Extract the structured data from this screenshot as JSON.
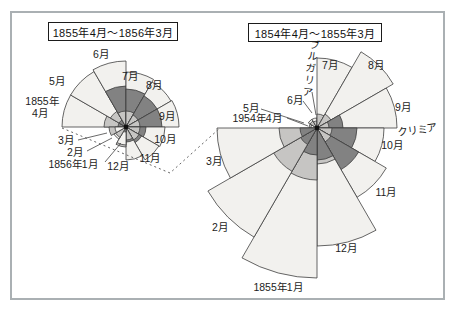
{
  "figure": {
    "width": 459,
    "height": 312,
    "frame_border_color": "#aab0b3",
    "background": "#ffffff"
  },
  "titles": {
    "left": "1855年4月～1856年3月",
    "right": "1854年4月～1855年3月"
  },
  "colors": {
    "light_wedge": "#f2f1ee",
    "dark_wedge": "#828282",
    "mid_wedge": "#c6c5c3",
    "outline": "#3f3f3f",
    "label_text": "#1c1c1c",
    "dashed_connector": "#666666",
    "pointer_line": "#444444",
    "center_dot": "#111111"
  },
  "chart_data": [
    {
      "id": "left",
      "type": "polar_area_rose",
      "title": "1855年4月～1856年3月",
      "center": [
        126,
        127
      ],
      "start_angle_deg": 270,
      "sector_deg": 30,
      "months": [
        "4月",
        "5月",
        "6月",
        "7月",
        "8月",
        "9月",
        "10月",
        "11月",
        "12月",
        "1月",
        "2月",
        "3月"
      ],
      "series": [
        {
          "name": "light",
          "radii": [
            64,
            64,
            66,
            55,
            52,
            53,
            39,
            38,
            33,
            18,
            14,
            11
          ]
        },
        {
          "name": "dark",
          "radii": [
            8,
            8,
            41,
            38,
            36,
            36,
            20,
            18,
            15,
            5,
            0,
            0
          ]
        },
        {
          "name": "mid",
          "radii": [
            22,
            18,
            16,
            16,
            14,
            14,
            14,
            15,
            13,
            20,
            12,
            17
          ]
        }
      ]
    },
    {
      "id": "right",
      "type": "polar_area_rose",
      "title": "1854年4月～1855年3月",
      "center": [
        317,
        128
      ],
      "start_angle_deg": 270,
      "sector_deg": 30,
      "months": [
        "4月",
        "5月",
        "6月",
        "7月",
        "8月",
        "9月",
        "10月",
        "11月",
        "12月",
        "1月",
        "2月",
        "3月"
      ],
      "series": [
        {
          "name": "light",
          "radii": [
            6,
            10,
            10,
            70,
            88,
            80,
            67,
            80,
            118,
            150,
            126,
            100
          ]
        },
        {
          "name": "dark",
          "radii": [
            0,
            0,
            0,
            0,
            3,
            26,
            40,
            48,
            32,
            27,
            19,
            17
          ]
        },
        {
          "name": "mid",
          "radii": [
            8,
            8,
            7,
            14,
            16,
            12,
            15,
            16,
            36,
            52,
            50,
            38
          ]
        }
      ]
    }
  ],
  "labels": [
    {
      "name": "left-jun",
      "text": "6月",
      "x": 101,
      "y": 54
    },
    {
      "name": "left-jul",
      "text": "7月",
      "x": 130,
      "y": 76
    },
    {
      "name": "left-aug",
      "text": "8月",
      "x": 154,
      "y": 85
    },
    {
      "name": "left-sep",
      "text": "9月",
      "x": 167,
      "y": 116
    },
    {
      "name": "left-oct",
      "text": "10月",
      "x": 165,
      "y": 139
    },
    {
      "name": "left-nov",
      "text": "11月",
      "x": 150,
      "y": 158
    },
    {
      "name": "left-dec",
      "text": "12月",
      "x": 118,
      "y": 166
    },
    {
      "name": "left-jan",
      "text": "1856年1月",
      "x": 73,
      "y": 164
    },
    {
      "name": "left-feb",
      "text": "2月",
      "x": 75,
      "y": 152
    },
    {
      "name": "left-mar",
      "text": "3月",
      "x": 66,
      "y": 140
    },
    {
      "name": "left-apr-year",
      "text": "1855年",
      "x": 42,
      "y": 101
    },
    {
      "name": "left-apr",
      "text": "4月",
      "x": 40,
      "y": 113
    },
    {
      "name": "left-may",
      "text": "5月",
      "x": 57,
      "y": 81
    },
    {
      "name": "right-jul",
      "text": "7月",
      "x": 330,
      "y": 65
    },
    {
      "name": "right-aug",
      "text": "8月",
      "x": 376,
      "y": 65
    },
    {
      "name": "right-sep",
      "text": "9月",
      "x": 403,
      "y": 107
    },
    {
      "name": "right-oct",
      "text": "10月",
      "x": 392,
      "y": 145
    },
    {
      "name": "right-nov",
      "text": "11月",
      "x": 386,
      "y": 192
    },
    {
      "name": "right-dec",
      "text": "12月",
      "x": 346,
      "y": 248
    },
    {
      "name": "right-jan",
      "text": "1855年1月",
      "x": 278,
      "y": 287
    },
    {
      "name": "right-feb",
      "text": "2月",
      "x": 220,
      "y": 227
    },
    {
      "name": "right-mar",
      "text": "3月",
      "x": 214,
      "y": 161
    },
    {
      "name": "right-apr",
      "text": "1954年4月",
      "x": 257,
      "y": 118
    },
    {
      "name": "right-may",
      "text": "5月",
      "x": 251,
      "y": 108
    },
    {
      "name": "right-jun",
      "text": "6月",
      "x": 295,
      "y": 100
    },
    {
      "name": "annotation-bulgaria",
      "text": "ブルガリア",
      "x": 310,
      "y": 69,
      "vertical": true,
      "rotate": 8
    },
    {
      "name": "annotation-crimea",
      "text": "クリミア",
      "x": 417,
      "y": 130,
      "rotate": -8
    }
  ],
  "pointer_lines": [
    {
      "name": "left-mar-pointer",
      "points": [
        [
          78,
          140
        ],
        [
          107,
          133
        ]
      ]
    },
    {
      "name": "left-feb-pointer",
      "points": [
        [
          87,
          151
        ],
        [
          112,
          138
        ]
      ]
    },
    {
      "name": "left-jan-pointer",
      "points": [
        [
          105,
          162
        ],
        [
          121,
          143
        ]
      ]
    },
    {
      "name": "right-jun-pointer",
      "points": [
        [
          303,
          101
        ],
        [
          312,
          113
        ]
      ]
    },
    {
      "name": "right-may-pointer",
      "points": [
        [
          261,
          109
        ],
        [
          304,
          123
        ]
      ]
    },
    {
      "name": "right-apr-pointer",
      "points": [
        [
          287,
          118
        ],
        [
          308,
          126
        ]
      ]
    },
    {
      "name": "bulgaria-pointer",
      "points": [
        [
          312,
          92
        ],
        [
          316,
          115
        ]
      ]
    }
  ],
  "connector": {
    "style": "dashed",
    "points": [
      [
        62,
        128
      ],
      [
        170,
        173
      ],
      [
        220,
        128
      ]
    ]
  }
}
